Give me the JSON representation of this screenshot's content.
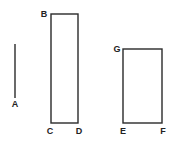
{
  "figure": {
    "stroke_color": "#2a2a2a",
    "background": "#ffffff",
    "line_segment": {
      "label": "A",
      "x": 15,
      "y1": 44,
      "y2": 98,
      "label_x": 15,
      "label_y": 107
    },
    "tall_rectangle": {
      "x": 51,
      "y": 14,
      "width": 27,
      "height": 109,
      "labels": {
        "B": {
          "text": "B",
          "x": 44,
          "y": 17
        },
        "C": {
          "text": "C",
          "x": 50,
          "y": 134
        },
        "D": {
          "text": "D",
          "x": 79,
          "y": 134
        }
      }
    },
    "short_rectangle": {
      "x": 123,
      "y": 49,
      "width": 39,
      "height": 74,
      "labels": {
        "G": {
          "text": "G",
          "x": 117,
          "y": 52
        },
        "E": {
          "text": "E",
          "x": 123,
          "y": 134
        },
        "F": {
          "text": "F",
          "x": 163,
          "y": 134
        }
      }
    }
  }
}
